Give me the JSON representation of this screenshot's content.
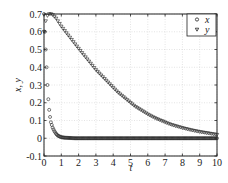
{
  "chart_data": {
    "type": "scatter",
    "title": "",
    "xlabel": "t",
    "ylabel": "x, y",
    "xlim": [
      0,
      10
    ],
    "ylim": [
      -0.1,
      0.7
    ],
    "xticks": [
      0,
      1,
      2,
      3,
      4,
      5,
      6,
      7,
      8,
      9,
      10
    ],
    "xtick_labels": [
      "0",
      "1",
      "2",
      "3",
      "4",
      "5",
      "6",
      "7",
      "8",
      "9",
      "10"
    ],
    "yticks": [
      -0.1,
      0,
      0.1,
      0.2,
      0.3,
      0.4,
      0.5,
      0.6,
      0.7
    ],
    "ytick_labels": [
      "-0.1",
      "0",
      "0.1",
      "0.2",
      "0.3",
      "0.4",
      "0.5",
      "0.6",
      "0.7"
    ],
    "grid": true,
    "legend_position": "upper right",
    "series": [
      {
        "name": "x",
        "marker": "circle",
        "x": [
          0,
          0.05,
          0.1,
          0.15,
          0.2,
          0.25,
          0.3,
          0.35,
          0.4,
          0.5,
          0.6,
          0.7,
          0.8,
          0.9,
          1.0,
          1.2,
          1.4,
          1.6,
          1.8,
          2.0,
          2.25,
          2.5,
          2.75,
          3.0,
          3.25,
          3.5,
          3.75,
          4.0,
          4.25,
          4.5,
          4.75,
          5.0,
          5.25,
          5.5,
          5.75,
          6.0,
          6.25,
          6.5,
          6.75,
          7.0,
          7.25,
          7.5,
          7.75,
          8.0,
          8.25,
          8.5,
          8.75,
          9.0,
          9.25,
          9.5,
          9.75,
          10.0
        ],
        "values": [
          0.7,
          0.6,
          0.5,
          0.4,
          0.3,
          0.22,
          0.16,
          0.12,
          0.09,
          0.06,
          0.04,
          0.025,
          0.015,
          0.01,
          0.006,
          0.003,
          0.002,
          0.001,
          0.0,
          0.0,
          0.0,
          0.0,
          0.0,
          0.0,
          0.0,
          0.0,
          0.0,
          0.0,
          0.0,
          0.0,
          0.0,
          0.0,
          0.0,
          0.0,
          0.0,
          0.0,
          0.0,
          0.0,
          0.0,
          0.0,
          0.0,
          0.0,
          0.0,
          0.0,
          0.0,
          0.0,
          0.0,
          0.0,
          0.0,
          0.0,
          0.0,
          0.0
        ]
      },
      {
        "name": "y",
        "marker": "triangle-down",
        "x": [
          0,
          0.05,
          0.1,
          0.15,
          0.2,
          0.25,
          0.3,
          0.4,
          0.5,
          0.6,
          0.7,
          0.8,
          0.9,
          1.0,
          1.2,
          1.4,
          1.6,
          1.8,
          2.0,
          2.25,
          2.5,
          2.75,
          3.0,
          3.25,
          3.5,
          3.75,
          4.0,
          4.25,
          4.5,
          4.75,
          5.0,
          5.25,
          5.5,
          5.75,
          6.0,
          6.25,
          6.5,
          6.75,
          7.0,
          7.25,
          7.5,
          7.75,
          8.0,
          8.25,
          8.5,
          8.75,
          9.0,
          9.25,
          9.5,
          9.75,
          10.0
        ],
        "values": [
          0.6,
          0.63,
          0.66,
          0.68,
          0.69,
          0.695,
          0.7,
          0.7,
          0.695,
          0.685,
          0.675,
          0.66,
          0.645,
          0.63,
          0.605,
          0.58,
          0.555,
          0.53,
          0.505,
          0.475,
          0.445,
          0.415,
          0.385,
          0.36,
          0.335,
          0.31,
          0.285,
          0.26,
          0.24,
          0.22,
          0.2,
          0.18,
          0.165,
          0.15,
          0.135,
          0.122,
          0.11,
          0.1,
          0.09,
          0.08,
          0.072,
          0.065,
          0.058,
          0.052,
          0.046,
          0.041,
          0.036,
          0.032,
          0.028,
          0.024,
          0.02
        ]
      }
    ]
  }
}
